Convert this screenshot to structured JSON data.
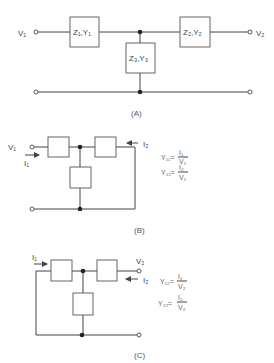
{
  "figure_a": {
    "caption": "(A)",
    "input_label": "V₁",
    "output_label": "V₂",
    "box1": "Z₁,Y₁",
    "box2": "Z₂,Y₂",
    "box3": "Z₃,Y₃"
  },
  "figure_b": {
    "caption": "(B)",
    "input_voltage": "V₁",
    "input_current": "I₁",
    "output_current": "I₂",
    "eq1_lhs": "Y₁₁=",
    "eq1_num": "I₁",
    "eq1_den": "V₁",
    "eq2_lhs": "Y₂₁=",
    "eq2_num": "I₂",
    "eq2_den": "V₁"
  },
  "figure_c": {
    "caption": "(C)",
    "input_current": "I₁",
    "output_voltage": "V₂",
    "output_current": "I₂",
    "eq1_lhs": "Y₁₂=",
    "eq1_num": "I₁",
    "eq1_den": "V₂",
    "eq2_lhs": "Y₂₂=",
    "eq2_num": "I₂",
    "eq2_den": "V₂"
  }
}
